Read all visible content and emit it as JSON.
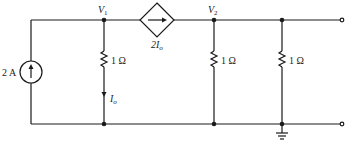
{
  "circuit": {
    "nodes": {
      "v1": "V",
      "v1_sub": "1",
      "v2": "V",
      "v2_sub": "2"
    },
    "current_source": {
      "label": "2 A",
      "direction": "up"
    },
    "dependent_source": {
      "label": "2I",
      "label_sub": "o",
      "type": "current-controlled current source",
      "direction": "right"
    },
    "resistors": [
      {
        "label": "1 Ω",
        "position": "between V1 and ground"
      },
      {
        "label": "1 Ω",
        "position": "between V2 and ground"
      },
      {
        "label": "1 Ω",
        "position": "output shunt"
      }
    ],
    "current_label": {
      "main": "I",
      "sub": "o"
    },
    "ground": "ground-symbol",
    "terminals": 2,
    "colors": {
      "stroke": "#1a1a1a",
      "background": "#ffffff"
    }
  }
}
